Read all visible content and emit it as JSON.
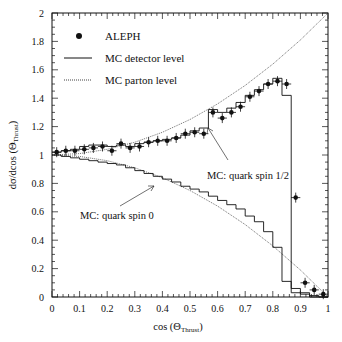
{
  "chart_data": {
    "type": "line",
    "title": "",
    "xlabel": "cos (Θ_Thrust)",
    "ylabel": "dσ/dcos (Θ_Thrust)",
    "xlim": [
      0,
      1
    ],
    "ylim": [
      0,
      2
    ],
    "grid": false,
    "legend_position": "upper-left",
    "x_ticks": [
      "0",
      "0.1",
      "0.2",
      "0.3",
      "0.4",
      "0.5",
      "0.6",
      "0.7",
      "0.8",
      "0.9",
      "1"
    ],
    "y_ticks": [
      "0",
      "0.2",
      "0.4",
      "0.6",
      "0.8",
      "1",
      "1.2",
      "1.4",
      "1.6",
      "1.8",
      "2"
    ],
    "legend": [
      {
        "label": "ALEPH",
        "style": "marker"
      },
      {
        "label": "MC detector level",
        "style": "solid"
      },
      {
        "label": "MC parton level",
        "style": "dotted"
      }
    ],
    "annotations": [
      {
        "text": "MC: quark spin 1/2",
        "x": 0.54,
        "y": 0.81,
        "arrow_to": [
          0.57,
          1.18
        ]
      },
      {
        "text": "MC: quark spin 0",
        "x": 0.12,
        "y": 0.6,
        "arrow_to": [
          0.34,
          0.83
        ]
      }
    ],
    "bin_edges": [
      0,
      0.0333,
      0.0667,
      0.1,
      0.1333,
      0.1667,
      0.2,
      0.2333,
      0.2667,
      0.3,
      0.3333,
      0.3667,
      0.4,
      0.4333,
      0.4667,
      0.5,
      0.5333,
      0.5667,
      0.6,
      0.6333,
      0.6667,
      0.7,
      0.7333,
      0.7667,
      0.8,
      0.8333,
      0.8667,
      0.9,
      0.9333,
      0.9667,
      1
    ],
    "series": [
      {
        "name": "ALEPH",
        "type": "scatter",
        "x": [
          0.017,
          0.05,
          0.083,
          0.117,
          0.15,
          0.183,
          0.217,
          0.25,
          0.283,
          0.317,
          0.35,
          0.383,
          0.417,
          0.45,
          0.483,
          0.517,
          0.55,
          0.583,
          0.617,
          0.65,
          0.683,
          0.717,
          0.75,
          0.783,
          0.817,
          0.85,
          0.883,
          0.917,
          0.95,
          0.983
        ],
        "y": [
          1.02,
          1.03,
          1.03,
          1.04,
          1.05,
          1.06,
          1.03,
          1.08,
          1.05,
          1.06,
          1.09,
          1.1,
          1.1,
          1.12,
          1.15,
          1.16,
          1.15,
          1.3,
          1.26,
          1.3,
          1.34,
          1.41,
          1.45,
          1.5,
          1.52,
          1.5,
          0.7,
          0.1,
          0.05,
          0.02
        ]
      },
      {
        "name": "MC detector level (spin 1/2)",
        "type": "step",
        "values": [
          1.02,
          1.03,
          1.04,
          1.06,
          1.07,
          1.07,
          1.06,
          1.07,
          1.06,
          1.08,
          1.09,
          1.1,
          1.11,
          1.12,
          1.14,
          1.17,
          1.19,
          1.32,
          1.3,
          1.33,
          1.37,
          1.42,
          1.46,
          1.5,
          1.54,
          1.42,
          0.03,
          0.02,
          0.01,
          0.0
        ]
      },
      {
        "name": "MC detector level (spin 0)",
        "type": "step",
        "values": [
          1.0,
          0.99,
          0.98,
          0.97,
          0.96,
          0.95,
          0.94,
          0.93,
          0.91,
          0.89,
          0.87,
          0.85,
          0.83,
          0.81,
          0.78,
          0.76,
          0.74,
          0.71,
          0.68,
          0.65,
          0.62,
          0.57,
          0.53,
          0.46,
          0.35,
          0.11,
          0.06,
          0.03,
          0.0,
          0.0
        ]
      },
      {
        "name": "MC parton level (spin 1/2)",
        "type": "line",
        "style": "dotted",
        "x": [
          0,
          0.1,
          0.2,
          0.3,
          0.4,
          0.5,
          0.6,
          0.7,
          0.8,
          0.9,
          1
        ],
        "y": [
          1.0,
          1.01,
          1.04,
          1.09,
          1.16,
          1.25,
          1.36,
          1.49,
          1.64,
          1.81,
          2.0
        ]
      },
      {
        "name": "MC parton level (spin 0)",
        "type": "line",
        "style": "dotted",
        "x": [
          0,
          0.1,
          0.2,
          0.3,
          0.4,
          0.5,
          0.6,
          0.7,
          0.8,
          0.9,
          1
        ],
        "y": [
          1.0,
          0.99,
          0.96,
          0.91,
          0.84,
          0.75,
          0.64,
          0.51,
          0.36,
          0.19,
          0.0
        ]
      }
    ]
  }
}
